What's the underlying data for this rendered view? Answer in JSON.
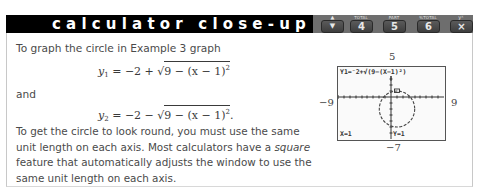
{
  "header": {
    "title": "calculator close-up",
    "keys": [
      {
        "top_label": "",
        "label": "▼",
        "up_label": "▲",
        "icon": "arrow-up-down-icon"
      },
      {
        "top_label": "TOTAL",
        "label": "4"
      },
      {
        "top_label": "PART",
        "label": "5"
      },
      {
        "top_label": "%TOTAL",
        "label": "6"
      },
      {
        "top_label": "yˣ",
        "label": "×"
      }
    ],
    "colors": {
      "bar": "#000000",
      "keystrip": "#6e6e6e",
      "key": "#4a4a4a"
    }
  },
  "body": {
    "intro": "To graph the circle in Example 3 graph",
    "eq1": {
      "lhs": "y",
      "sub": "1",
      "rhs_prefix": " = −2 + √",
      "radicand": "9 − (x − 1)",
      "sup": "2",
      "end": ""
    },
    "conj": "and",
    "eq2": {
      "lhs": "y",
      "sub": "2",
      "rhs_prefix": " = −2 − √",
      "radicand": "9 − (x − 1)",
      "sup": "2",
      "end": "."
    },
    "para_part1": "To get the circle to look round, you must use the same unit length on each axis. Most calculators have a ",
    "para_em": "square",
    "para_part2": " feature that automatically adjusts the window to use the same unit length on each axis."
  },
  "calculator_screen": {
    "function_text": "Y1=⁻2+√(9−(X−1)²)",
    "cursor_x": "X=1",
    "cursor_y": "Y=1",
    "window": {
      "ymax": "5",
      "xmin": "−9",
      "xmax": "9",
      "ymin": "−7"
    }
  }
}
